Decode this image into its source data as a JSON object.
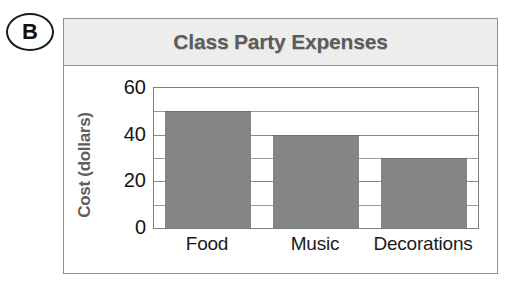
{
  "item_label": {
    "letter": "B"
  },
  "chart_data": {
    "type": "bar",
    "title": "Class Party Expenses",
    "xlabel": "",
    "ylabel": "Cost (dollars)",
    "categories": [
      "Food",
      "Music",
      "Decorations"
    ],
    "values": [
      50,
      40,
      30
    ],
    "ylim": [
      0,
      60
    ],
    "ytick_labels": [
      "0",
      "20",
      "40",
      "60"
    ],
    "ytick_values": [
      0,
      20,
      40,
      60
    ],
    "gridline_values": [
      10,
      20,
      30,
      40,
      50
    ],
    "grid": true,
    "legend": "none",
    "bar_color": "#858585",
    "title_color": "#5b5b5b",
    "title_band_color": "#ededed",
    "frame_color": "#8f8f8f",
    "text_color": "#1a1a1a"
  }
}
